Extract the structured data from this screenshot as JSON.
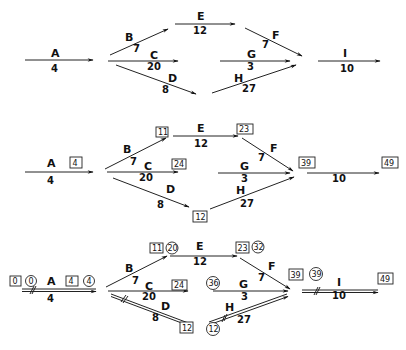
{
  "diagram": {
    "type": "critical-path-network",
    "stages": [
      {
        "name": "stage-1-network",
        "activities": [
          {
            "id": "A",
            "label": "A",
            "duration": "4"
          },
          {
            "id": "B",
            "label": "B",
            "duration": "7"
          },
          {
            "id": "C",
            "label": "C",
            "duration": "20"
          },
          {
            "id": "D",
            "label": "D",
            "duration": "8"
          },
          {
            "id": "E",
            "label": "E",
            "duration": "12"
          },
          {
            "id": "F",
            "label": "F",
            "duration": "7"
          },
          {
            "id": "G",
            "label": "G",
            "duration": "3"
          },
          {
            "id": "H",
            "label": "H",
            "duration": "27"
          },
          {
            "id": "I",
            "label": "I",
            "duration": "10"
          }
        ]
      },
      {
        "name": "stage-2-earliest-times",
        "activities": [
          {
            "id": "A",
            "label": "A",
            "duration": "4"
          },
          {
            "id": "B",
            "label": "B",
            "duration": "7"
          },
          {
            "id": "C",
            "label": "C",
            "duration": "20"
          },
          {
            "id": "D",
            "label": "D",
            "duration": "8"
          },
          {
            "id": "E",
            "label": "E",
            "duration": "12"
          },
          {
            "id": "F",
            "label": "F",
            "duration": "7"
          },
          {
            "id": "G",
            "label": "G",
            "duration": "3"
          },
          {
            "id": "H",
            "label": "H",
            "duration": "27"
          },
          {
            "id": "I",
            "label": "",
            "duration": "10"
          }
        ],
        "boxes": {
          "A_end": "4",
          "B_end": "11",
          "E_end": "23",
          "C_end": "24",
          "D_end": "12",
          "FGH_end": "39",
          "I_end": "49"
        }
      },
      {
        "name": "stage-3-critical-path",
        "activities": [
          {
            "id": "A",
            "label": "A",
            "duration": "4"
          },
          {
            "id": "B",
            "label": "B",
            "duration": "7"
          },
          {
            "id": "C",
            "label": "C",
            "duration": "20"
          },
          {
            "id": "D",
            "label": "D",
            "duration": "8"
          },
          {
            "id": "E",
            "label": "E",
            "duration": "12"
          },
          {
            "id": "F",
            "label": "F",
            "duration": "7"
          },
          {
            "id": "G",
            "label": "G",
            "duration": "3"
          },
          {
            "id": "H",
            "label": "H",
            "duration": "27"
          },
          {
            "id": "I",
            "label": "I",
            "duration": "10"
          }
        ],
        "boxes": {
          "A_start": "0",
          "A_end": "4",
          "B_end": "11",
          "E_end": "23",
          "C_end": "24",
          "D_end": "12",
          "FGH_end": "39",
          "I_end": "49"
        },
        "circles": {
          "A_start": "0",
          "A_end": "4",
          "E_start": "20",
          "E_end": "32",
          "G_start": "36",
          "H_start": "12",
          "I_start": "39"
        },
        "critical_path": [
          "A",
          "D",
          "H",
          "I"
        ]
      }
    ]
  }
}
